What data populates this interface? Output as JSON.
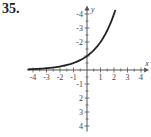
{
  "problem_number": "35.",
  "chart_data": {
    "type": "line",
    "title": "",
    "xlabel": "x",
    "ylabel": "y",
    "xlim": [
      -4.4,
      4.6
    ],
    "ylim": [
      -4.4,
      4.6
    ],
    "x_ticks": [
      -4,
      -3,
      -2,
      -1,
      1,
      2,
      3,
      4
    ],
    "y_ticks": [
      -4,
      -3,
      -2,
      -1,
      2,
      3,
      4
    ],
    "x_tick_labels": [
      "-4",
      "-3",
      "-2",
      "-1",
      "1",
      "2",
      "3",
      "4"
    ],
    "y_tick_labels": [
      "4",
      "3",
      "2",
      "-1",
      "-2",
      "-3",
      "-4"
    ],
    "grid": false,
    "series": [
      {
        "name": "y = 2^x",
        "x": [
          -4.4,
          -4,
          -3,
          -2,
          -1,
          0,
          1,
          1.5,
          2,
          2.1
        ],
        "y": [
          0.05,
          0.0625,
          0.125,
          0.25,
          0.5,
          1,
          2,
          2.83,
          4,
          4.29
        ]
      }
    ]
  }
}
